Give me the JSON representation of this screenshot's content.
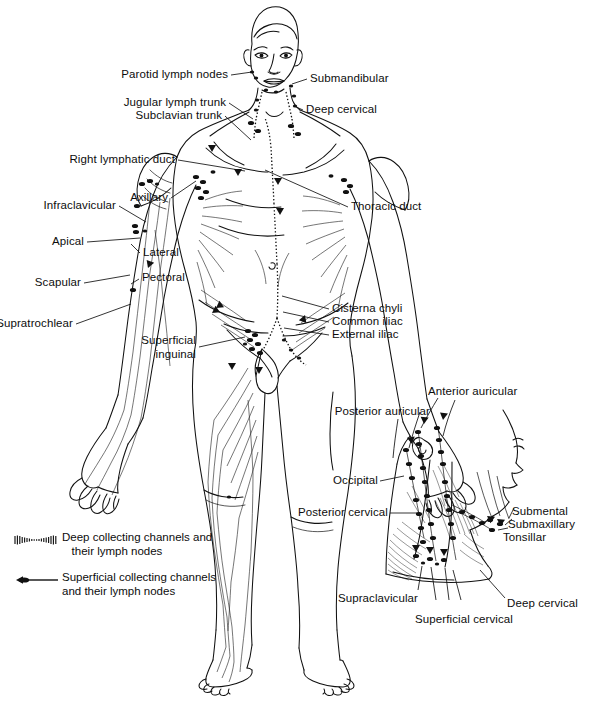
{
  "figure": {
    "background_color": "#ffffff",
    "ink_color": "#111111"
  },
  "labels": {
    "parotid_lymph_nodes": "Parotid lymph nodes",
    "jugular_lymph_trunk": "Jugular lymph trunk",
    "subclavian_trunk": "Subclavian trunk",
    "right_lymphatic_duct": "Right lymphatic duct",
    "axillary": "Axillary",
    "infraclavicular": "Infraclavicular",
    "apical": "Apical",
    "lateral": "Lateral",
    "scapular": "Scapular",
    "pectoral": "Pectoral",
    "supratrochlear": "Supratrochlear",
    "superficial_inguinal": "Superficial\ninguinal",
    "submandibular": "Submandibular",
    "deep_cervical": "Deep cervical",
    "thoracic_duct": "Thoracic duct",
    "cisterna_chyli": "Cisterna chyli",
    "common_iliac": "Common iliac",
    "external_iliac": "External iliac",
    "anterior_auricular": "Anterior auricular",
    "posterior_auricular": "Posterior auricular",
    "occipital": "Occipital",
    "posterior_cervical": "Posterior cervical",
    "submental": "Submental",
    "submaxillary": "Submaxillary",
    "tonsillar": "Tonsillar",
    "supraclavicular": "Supraclavicular",
    "superficial_cervical": "Superficial cervical",
    "deep_cervical_inset": "Deep cervical"
  },
  "legend": {
    "items": [
      {
        "symbol": "deep-collecting-channel-symbol",
        "text": "Deep collecting channels and\n   their lymph nodes"
      },
      {
        "symbol": "superficial-collecting-channel-symbol",
        "text": "Superficial collecting channels\nand their lymph nodes"
      }
    ]
  }
}
